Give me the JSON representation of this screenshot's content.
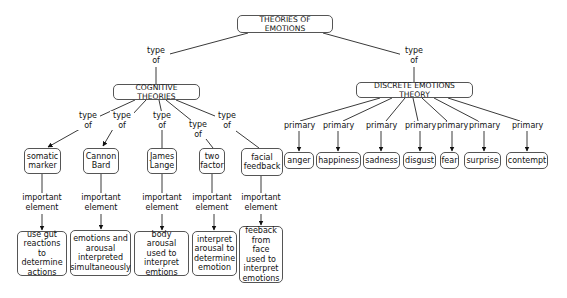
{
  "root": {
    "label": "THEORIES OF EMOTIONS"
  },
  "root_links": {
    "left": "type\nof",
    "right": "type\nof"
  },
  "cognitive": {
    "label": "COGNITIVE THEORIES",
    "link_labels": [
      "type\nof",
      "type\nof",
      "type\nof",
      "type\nof",
      "type\nof"
    ],
    "theories": [
      {
        "name": "somatic\nmarker",
        "link": "important\nelement",
        "element": "use gut\nreactions to\ndetermine\nactions"
      },
      {
        "name": "Cannon\nBard",
        "link": "important\nelement",
        "element": "emotions and\narousal\ninterpreted\nsimultaneously"
      },
      {
        "name": "James\nLange",
        "link": "important\nelement",
        "element": "body arousal\nused to\ninterpret\nemtions"
      },
      {
        "name": "two\nfactor",
        "link": "important\nelement",
        "element": "interpret\narousal to\ndetermine\nemotion"
      },
      {
        "name": "facial\nfeedback",
        "link": "important\nelement",
        "element": "feeback\nfrom face\nused to\ninterpret\nemotions"
      }
    ]
  },
  "discrete": {
    "label": "DISCRETE EMOTIONS THEORY",
    "link_label": "primary",
    "emotions": [
      "anger",
      "happiness",
      "sadness",
      "disgust",
      "fear",
      "surprise",
      "contempt"
    ]
  },
  "colors": {
    "line": "#3a3a3a",
    "border": "#555555",
    "text": "#111111",
    "background": "#ffffff"
  }
}
